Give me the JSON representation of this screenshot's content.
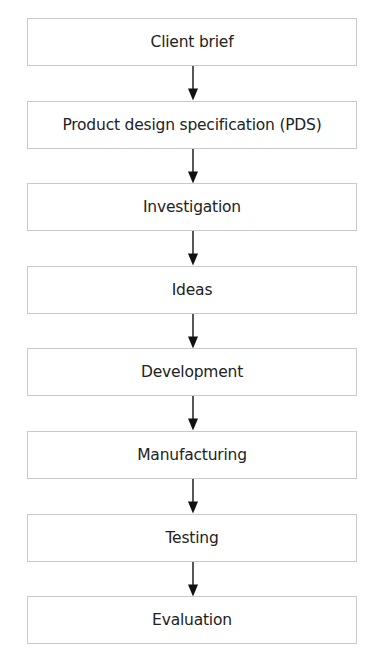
{
  "diagram": {
    "type": "flowchart",
    "direction": "top-to-bottom",
    "steps": [
      {
        "label": "Client brief"
      },
      {
        "label": "Product design specification (PDS)"
      },
      {
        "label": "Investigation"
      },
      {
        "label": "Ideas"
      },
      {
        "label": "Development"
      },
      {
        "label": "Manufacturing"
      },
      {
        "label": "Testing"
      },
      {
        "label": "Evaluation"
      }
    ],
    "connector": "down-arrow",
    "colors": {
      "box_border": "#c9c9c9",
      "text": "#222222",
      "arrow": "#111111",
      "background": "#ffffff"
    }
  }
}
